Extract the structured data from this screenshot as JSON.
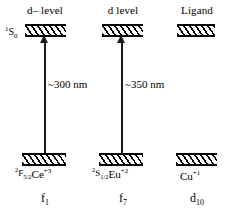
{
  "diagram": {
    "columns": [
      {
        "id": "ce3",
        "level_caption": "d– level",
        "excited_term_pre_sup": "1",
        "excited_term_symbol": "S",
        "excited_term_sub": "0",
        "ground_term_pre_sup": "2",
        "ground_term_symbol": "F",
        "ground_term_sub": "5/2",
        "ion_symbol": "Ce",
        "ion_charge": "+3",
        "transition_label": "~300 nm",
        "configuration_base": "f",
        "configuration_sub": "1"
      },
      {
        "id": "eu2",
        "level_caption": "d level",
        "excited_term_pre_sup": "",
        "excited_term_symbol": "",
        "excited_term_sub": "",
        "ground_term_pre_sup": "2",
        "ground_term_symbol": "S",
        "ground_term_sub": "1/2",
        "ion_symbol": "Eu",
        "ion_charge": "+2",
        "transition_label": "~350 nm",
        "configuration_base": "f",
        "configuration_sub": "7"
      },
      {
        "id": "cu1",
        "level_caption": "Ligand",
        "excited_term_pre_sup": "",
        "excited_term_symbol": "",
        "excited_term_sub": "",
        "ground_term_pre_sup": "",
        "ground_term_symbol": "",
        "ground_term_sub": "",
        "ion_symbol": "Cu",
        "ion_charge": "+1",
        "transition_label": "",
        "configuration_base": "d",
        "configuration_sub": "10"
      }
    ],
    "colors": {
      "background": "#ffffff",
      "ink": "#000000",
      "arrow": "#1a1a1a"
    }
  }
}
